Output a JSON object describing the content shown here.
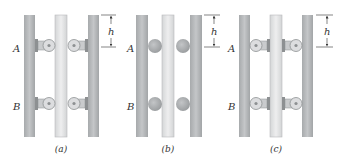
{
  "figure": {
    "panels": [
      {
        "id": "a",
        "caption": "(a)",
        "support_type": "rollers-on-outer-rails",
        "point_labels": [
          "A",
          "B"
        ],
        "dimension_label": "h"
      },
      {
        "id": "b",
        "caption": "(b)",
        "support_type": "balls",
        "point_labels": [
          "A",
          "B"
        ],
        "dimension_label": "h"
      },
      {
        "id": "c",
        "caption": "(c)",
        "support_type": "rollers-on-center-bar",
        "point_labels": [
          "A",
          "B"
        ],
        "dimension_label": "h"
      }
    ]
  },
  "colors": {
    "rail": "#b9bbbd",
    "rail_edge": "#8f9294",
    "center_bar": "#e2e3e4",
    "roller": "#d9dadb",
    "ball": "#a9abad",
    "text": "#333333"
  }
}
